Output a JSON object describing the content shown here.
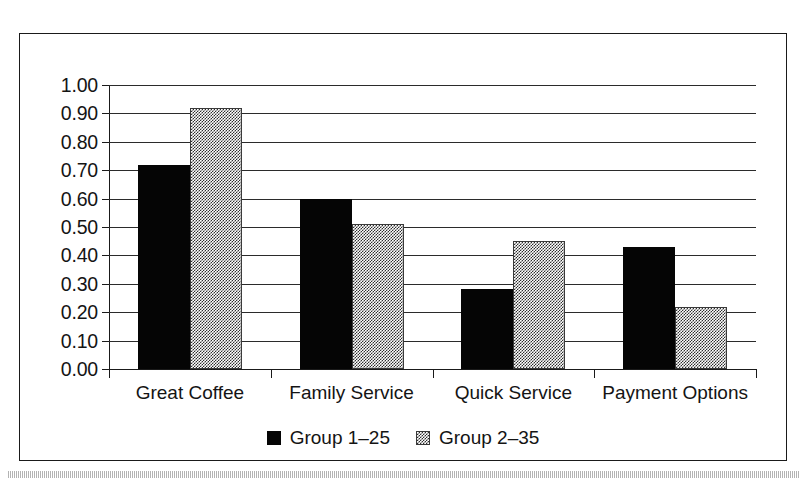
{
  "figure": {
    "frame_visible": true,
    "background_color": "#ffffff",
    "scan_artifact_band": true
  },
  "chart_data": {
    "type": "bar",
    "title": "",
    "subtitle": "",
    "xlabel": "",
    "ylabel": "",
    "categories": [
      "Great Coffee",
      "Family Service",
      "Quick Service",
      "Payment Options"
    ],
    "series": [
      {
        "name": "Group 1–25",
        "color": "#050505",
        "fill": "solid-black",
        "values": [
          0.72,
          0.6,
          0.28,
          0.43
        ]
      },
      {
        "name": "Group 2–35",
        "color": "#2e2e2e",
        "fill": "checkered-grey",
        "values": [
          0.92,
          0.51,
          0.45,
          0.22
        ]
      }
    ],
    "ylim": [
      0.0,
      1.0
    ],
    "ytick_values": [
      0.0,
      0.1,
      0.2,
      0.3,
      0.4,
      0.5,
      0.6,
      0.7,
      0.8,
      0.9,
      1.0
    ],
    "ytick_labels": [
      "0.00",
      "0.10",
      "0.20",
      "0.30",
      "0.40",
      "0.50",
      "0.60",
      "0.70",
      "0.80",
      "0.90",
      "1.00"
    ],
    "grid": true,
    "grid_axis": "y",
    "legend": true,
    "legend_position": "bottom-center",
    "legend_entries": [
      "Group 1–25",
      "Group 2–35"
    ]
  }
}
